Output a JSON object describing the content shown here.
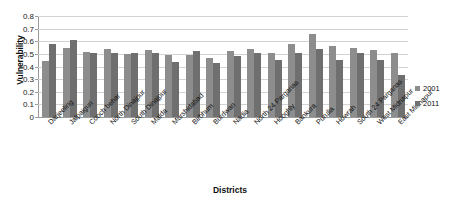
{
  "chart_data": {
    "type": "bar",
    "title": "",
    "xlabel": "Districts",
    "ylabel": "Vulnerability",
    "ylim": [
      0,
      0.8
    ],
    "ytick_labels": [
      "0.8",
      "0.7",
      "0.6",
      "0.5",
      "0.4",
      "0.3",
      "0.2",
      "0.1",
      "0"
    ],
    "ytick_values": [
      0.8,
      0.7,
      0.6,
      0.5,
      0.4,
      0.3,
      0.2,
      0.1,
      0
    ],
    "grid": true,
    "legend_position": "right",
    "categories": [
      "Darjeeling",
      "Jalpaiguri",
      "Cooch behar",
      "North Dinajpur",
      "South Dinajpur",
      "Malda",
      "Murshidabad",
      "Birbhum",
      "Burdwan",
      "Nadia",
      "North 24 Parganas",
      "Hooghly",
      "Bankura",
      "Purulia",
      "Howrah",
      "South 24 Parganas",
      "West Midnapur",
      "East Midnapur"
    ],
    "series": [
      {
        "name": "2001",
        "color": "#8d8d8d",
        "values": [
          0.44,
          0.55,
          0.515,
          0.54,
          0.5,
          0.53,
          0.49,
          0.49,
          0.47,
          0.52,
          0.54,
          0.51,
          0.58,
          0.66,
          0.56,
          0.55,
          0.53,
          0.51
        ]
      },
      {
        "name": "2011",
        "color": "#6f6f6f",
        "values": [
          0.58,
          0.61,
          0.505,
          0.51,
          0.505,
          0.51,
          0.435,
          0.525,
          0.43,
          0.48,
          0.51,
          0.455,
          0.51,
          0.54,
          0.45,
          0.51,
          0.45,
          0.33
        ]
      }
    ]
  },
  "legend": {
    "items": [
      {
        "label": "2001",
        "color": "#8d8d8d"
      },
      {
        "label": "2011",
        "color": "#6f6f6f"
      }
    ]
  }
}
